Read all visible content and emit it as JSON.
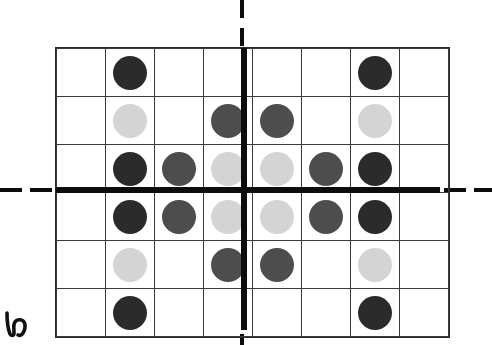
{
  "figure": {
    "title": "",
    "caption": "",
    "corner_mark": "h-cursive-glyph"
  },
  "colors": {
    "dark": "#2b2b2b",
    "medium": "#4d4d4d",
    "light": "#d4d4d4",
    "grid_line": "#3a3a3a",
    "axis_line": "#0d0d0d",
    "background": "#ffffff"
  },
  "chart_data": {
    "type": "heatmap",
    "title": "",
    "xlabel": "",
    "ylabel": "",
    "grid": true,
    "columns": 8,
    "rows": 6,
    "legend": [
      {
        "name": "dark",
        "value": 3,
        "color": "#2b2b2b"
      },
      {
        "name": "medium",
        "value": 2,
        "color": "#4d4d4d"
      },
      {
        "name": "light",
        "value": 1,
        "color": "#d4d4d4"
      },
      {
        "name": "empty",
        "value": 0,
        "color": "#ffffff"
      }
    ],
    "axes": {
      "vertical_axis_after_column": 4,
      "horizontal_axis_after_row": 3,
      "dashed_extensions": true
    },
    "cells": [
      [
        "empty",
        "dark",
        "empty",
        "empty",
        "empty",
        "empty",
        "dark",
        "empty"
      ],
      [
        "empty",
        "light",
        "empty",
        "medium",
        "medium",
        "empty",
        "light",
        "empty"
      ],
      [
        "empty",
        "dark",
        "medium",
        "light",
        "light",
        "medium",
        "dark",
        "empty"
      ],
      [
        "empty",
        "dark",
        "medium",
        "light",
        "light",
        "medium",
        "dark",
        "empty"
      ],
      [
        "empty",
        "light",
        "empty",
        "medium",
        "medium",
        "empty",
        "light",
        "empty"
      ],
      [
        "empty",
        "dark",
        "empty",
        "empty",
        "empty",
        "empty",
        "dark",
        "empty"
      ]
    ]
  },
  "dashes": {
    "left": [
      {
        "x": 0,
        "y": 188,
        "w": 22
      },
      {
        "x": 30,
        "y": 188,
        "w": 22
      }
    ],
    "right": [
      {
        "x": 444,
        "y": 188,
        "w": 22
      },
      {
        "x": 474,
        "y": 188,
        "w": 18
      }
    ],
    "top": [
      {
        "x": 240,
        "y": 0,
        "h": 18
      },
      {
        "x": 240,
        "y": 28,
        "h": 18
      }
    ],
    "bottom": [
      {
        "x": 240,
        "y": 334,
        "h": 11
      }
    ]
  }
}
